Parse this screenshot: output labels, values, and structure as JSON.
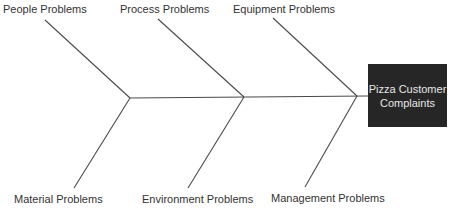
{
  "diagram": {
    "type": "fishbone",
    "effect": "Pizza Customer\nComplaints",
    "colors": {
      "line": "#4a4a4a",
      "box_bg": "#262626",
      "box_text": "#e6e6e6",
      "label_text": "#333333"
    },
    "categories_top": [
      {
        "label": "People Problems"
      },
      {
        "label": "Process Problems"
      },
      {
        "label": "Equipment Problems"
      }
    ],
    "categories_bottom": [
      {
        "label": "Material Problems"
      },
      {
        "label": "Environment Problems"
      },
      {
        "label": "Management Problems"
      }
    ]
  }
}
